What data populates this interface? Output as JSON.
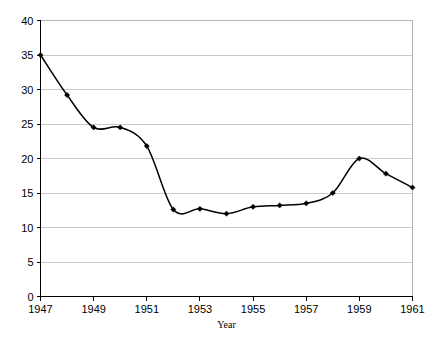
{
  "chart_data": {
    "type": "line",
    "title": "",
    "subtitle": "",
    "xlabel": "Year",
    "ylabel": "",
    "xlim": [
      1947,
      1961
    ],
    "ylim": [
      0,
      40
    ],
    "ytick_step": 5,
    "xtick_step": 2,
    "grid": "horizontal",
    "legend": "none",
    "smoothing": "spline",
    "marker": "diamond",
    "line_color": "#000000",
    "grid_color": "#c8c8c8",
    "axis_color": "#000000",
    "x": [
      1947,
      1948,
      1949,
      1950,
      1951,
      1952,
      1953,
      1954,
      1955,
      1956,
      1957,
      1958,
      1959,
      1960,
      1961
    ],
    "values": [
      35.0,
      29.2,
      24.5,
      24.5,
      21.8,
      12.6,
      12.7,
      12.0,
      13.0,
      13.2,
      13.5,
      15.0,
      20.0,
      17.8,
      15.8
    ],
    "xticks": [
      1947,
      1949,
      1951,
      1953,
      1955,
      1957,
      1959,
      1961
    ],
    "xtick_labels": [
      "1947",
      "1949",
      "1951",
      "1953",
      "1955",
      "1957",
      "1959",
      "1961"
    ],
    "yticks": [
      0,
      5,
      10,
      15,
      20,
      25,
      30,
      35,
      40
    ],
    "ytick_labels": [
      "0",
      "5",
      "10",
      "15",
      "20",
      "25",
      "30",
      "35",
      "40"
    ]
  },
  "axes": {
    "x_title": "Year"
  }
}
